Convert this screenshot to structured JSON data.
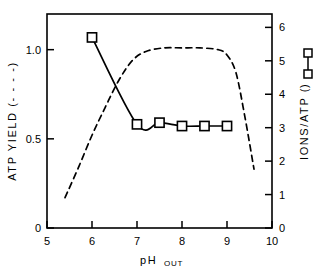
{
  "chart_data": {
    "type": "line",
    "title": "",
    "xlabel": "pH",
    "xlabel_sub": "OUT",
    "xlim": [
      5,
      10
    ],
    "xticks": [
      "5",
      "6",
      "7",
      "8",
      "9",
      "10"
    ],
    "xtick_values": [
      5,
      6,
      7,
      8,
      9,
      10
    ],
    "grid": false,
    "legend_position": "axis-labels",
    "axes": [
      {
        "id": "left",
        "label": "ATP YIELD (----)",
        "label_text": "ATP YIELD  (- - - -)",
        "ylim": [
          0,
          1.2
        ],
        "yticks": [
          "0",
          "0.5",
          "1.0"
        ],
        "ytick_values": [
          0,
          0.5,
          1.0
        ]
      },
      {
        "id": "right",
        "label": "IONS/ATP",
        "label_text": "IONS/ATP  (",
        "label_text_end": ")",
        "ylim": [
          0,
          6.4
        ],
        "yticks": [
          "0",
          "1",
          "2",
          "3",
          "4",
          "5",
          "6"
        ],
        "ytick_values": [
          0,
          1,
          2,
          3,
          4,
          5,
          6
        ]
      }
    ],
    "series": [
      {
        "name": "IONS/ATP",
        "axis": "right",
        "style": "solid",
        "marker": "open-square",
        "color": "#000000",
        "x": [
          6.0,
          7.0,
          7.5,
          8.0,
          8.5,
          9.0
        ],
        "y": [
          5.7,
          3.1,
          3.15,
          3.05,
          3.05,
          3.05
        ]
      },
      {
        "name": "ATP YIELD",
        "axis": "left",
        "style": "dashed",
        "marker": "none",
        "color": "#000000",
        "x": [
          5.4,
          5.7,
          6.0,
          6.3,
          6.6,
          6.9,
          7.2,
          7.6,
          8.0,
          8.4,
          8.8,
          9.0,
          9.2,
          9.4,
          9.6
        ],
        "y": [
          0.17,
          0.34,
          0.52,
          0.68,
          0.83,
          0.94,
          0.99,
          1.01,
          1.01,
          1.01,
          1.0,
          0.97,
          0.87,
          0.62,
          0.33
        ]
      }
    ]
  }
}
